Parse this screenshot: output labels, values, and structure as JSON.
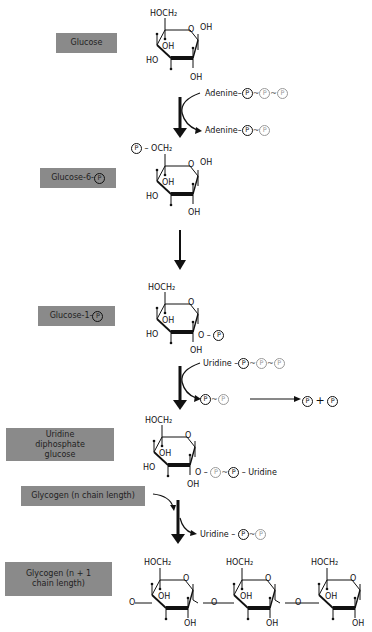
{
  "steps": [
    {
      "label": "Glucose"
    },
    {
      "label": "Glucose-6-",
      "suffix_icon": "P"
    },
    {
      "label": "Glucose-1-",
      "suffix_icon": "P"
    },
    {
      "label": "Uridine diphosphate glucose"
    },
    {
      "label": "Glycogen (n chain length)"
    },
    {
      "label": "Glycogen (n + 1 chain length)"
    }
  ],
  "molecule_labels": {
    "hoch2": "HOCH₂",
    "poch2": "OCH₂",
    "oh": "OH",
    "ho": "HO",
    "o": "O"
  },
  "reactions": {
    "atp": {
      "base": "Adenine",
      "phosphates": [
        "P",
        "P",
        "P"
      ]
    },
    "adp": {
      "base": "Adenine",
      "phosphates": [
        "P",
        "P"
      ]
    },
    "utp": {
      "base": "Uridine",
      "phosphates": [
        "P",
        "P",
        "P"
      ]
    },
    "ppi": {
      "phosphates": [
        "P",
        "P"
      ]
    },
    "pi_products": [
      "P",
      "P"
    ],
    "plus": "+",
    "udp_tail": "Uridine",
    "udp_product": {
      "base": "Uridine",
      "phosphates": [
        "P",
        "P"
      ]
    }
  }
}
